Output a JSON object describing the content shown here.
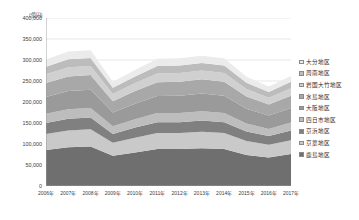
{
  "chart_data": {
    "type": "area",
    "stacked": true,
    "title": "",
    "subtitle": "",
    "xlabel": "",
    "ylabel": "",
    "unit_label": "(億円)",
    "grid": true,
    "legend_position": "right",
    "x": [
      "2006年",
      "2007年",
      "2008年",
      "2009年",
      "2010年",
      "2011年",
      "2012年",
      "2013年",
      "2014年",
      "2015年",
      "2016年",
      "2017年"
    ],
    "categories": [
      "2006年",
      "2007年",
      "2008年",
      "2009年",
      "2010年",
      "2011年",
      "2012年",
      "2013年",
      "2014年",
      "2015年",
      "2016年",
      "2017年"
    ],
    "ylim": [
      0,
      400000
    ],
    "yticks": [
      0,
      50000,
      100000,
      150000,
      200000,
      250000,
      300000,
      350000,
      400000
    ],
    "ytick_labels": [
      "0",
      "50,000",
      "100,000",
      "150,000",
      "200,000",
      "250,000",
      "300,000",
      "350,000",
      "400,000"
    ],
    "series": [
      {
        "name": "鹿島地区",
        "color": "#6f6f6f",
        "values": [
          86000,
          92000,
          94000,
          72000,
          80000,
          88000,
          88000,
          90000,
          88000,
          74000,
          68000,
          76000
        ]
      },
      {
        "name": "京葉地区",
        "color": "#c9c9c9",
        "values": [
          38000,
          40000,
          41000,
          31000,
          35000,
          38000,
          38000,
          39000,
          38000,
          33000,
          30000,
          33000
        ]
      },
      {
        "name": "京浜地区",
        "color": "#808080",
        "values": [
          26000,
          28000,
          28000,
          21000,
          24000,
          26000,
          26000,
          27000,
          26000,
          23000,
          21000,
          23000
        ]
      },
      {
        "name": "四日市地区",
        "color": "#bdbdbd",
        "values": [
          22000,
          23000,
          23000,
          18000,
          20000,
          22000,
          22000,
          22000,
          22000,
          19000,
          17000,
          19000
        ]
      },
      {
        "name": "大阪地区",
        "color": "#9a9a9a",
        "values": [
          40000,
          43000,
          43000,
          33000,
          37000,
          40000,
          41000,
          42000,
          41000,
          35000,
          32000,
          35000
        ]
      },
      {
        "name": "水島地区",
        "color": "#a8a8a8",
        "values": [
          33000,
          35000,
          35000,
          27000,
          30000,
          33000,
          33000,
          34000,
          33000,
          29000,
          26000,
          29000
        ]
      },
      {
        "name": "岩国大竹地区",
        "color": "#d0d0d0",
        "values": [
          21000,
          22000,
          22000,
          17000,
          19000,
          21000,
          21000,
          21000,
          21000,
          18000,
          16000,
          18000
        ]
      },
      {
        "name": "周南地区",
        "color": "#bcbcbc",
        "values": [
          18000,
          19000,
          19000,
          15000,
          16000,
          18000,
          18000,
          18000,
          18000,
          15000,
          14000,
          15000
        ]
      },
      {
        "name": "大分地区",
        "color": "#ebebeb",
        "values": [
          17000,
          18000,
          18000,
          14000,
          15000,
          17000,
          17000,
          17000,
          17000,
          14000,
          13000,
          14000
        ]
      }
    ]
  },
  "legend": {
    "items": [
      {
        "label": "大分地区",
        "color": "#ebebeb"
      },
      {
        "label": "周南地区",
        "color": "#bcbcbc"
      },
      {
        "label": "岩国大竹地区",
        "color": "#d0d0d0"
      },
      {
        "label": "水島地区",
        "color": "#a8a8a8"
      },
      {
        "label": "大阪地区",
        "color": "#9a9a9a"
      },
      {
        "label": "四日市地区",
        "color": "#bdbdbd"
      },
      {
        "label": "京浜地区",
        "color": "#808080"
      },
      {
        "label": "京葉地区",
        "color": "#c9c9c9"
      },
      {
        "label": "鹿島地区",
        "color": "#6f6f6f"
      }
    ]
  },
  "axes": {
    "axis_color": "#9b9b9b",
    "grid_color": "#d6d6d6",
    "tick_text_color": "#3c3c3c"
  }
}
